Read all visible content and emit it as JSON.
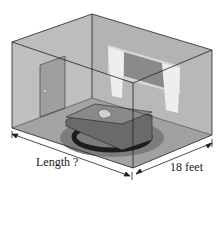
{
  "diagram": {
    "labels": {
      "length": "Length ?",
      "width": "18 feet"
    },
    "colors": {
      "wall": "#b8b8b8",
      "floor": "#8f8f8f",
      "edge": "#222222",
      "rug_outer": "#7a7a7a",
      "rug_ring": "#1e1e1e",
      "table": "#6a6a6a",
      "window": "#8a8a8a",
      "curtain": "#e6e6e6",
      "door": "#9a9a9a"
    }
  }
}
